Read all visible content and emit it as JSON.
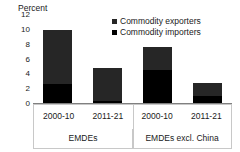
{
  "chart_data": {
    "type": "bar",
    "subtype": "stacked-bar-grouped",
    "title": "",
    "subtitle": "",
    "xlabel": "",
    "ylabel": "Percent",
    "ylim": [
      0,
      12
    ],
    "ytick_labels": [
      "0",
      "2",
      "4",
      "6",
      "8",
      "10",
      "12"
    ],
    "ytick_values": [
      0,
      2,
      4,
      6,
      8,
      10,
      12
    ],
    "grid": false,
    "legend_position": "top-right",
    "categories": [
      "2000-10",
      "2011-21",
      "2000-10",
      "2011-21"
    ],
    "groups": [
      {
        "label": "EMDEs",
        "categories": [
          "2000-10",
          "2011-21"
        ]
      },
      {
        "label": "EMDEs excl. China",
        "categories": [
          "2000-10",
          "2011-21"
        ]
      }
    ],
    "series": [
      {
        "name": "Commodity importers",
        "color": "#000000",
        "values": [
          2.5,
          0.3,
          4.4,
          1.0
        ]
      },
      {
        "name": "Commodity exporters",
        "color": "#262626",
        "values": [
          7.3,
          4.4,
          3.1,
          1.7
        ]
      }
    ],
    "totals": [
      9.8,
      4.7,
      7.5,
      2.7
    ],
    "annotations": []
  },
  "axis": {
    "title": "Percent"
  },
  "legend": {
    "items": [
      {
        "label": "Commodity exporters",
        "color": "#262626"
      },
      {
        "label": "Commodity importers",
        "color": "#000000"
      }
    ]
  },
  "xaxis": {
    "periods": [
      "2000-10",
      "2011-21",
      "2000-10",
      "2011-21"
    ],
    "groups": [
      "EMDEs",
      "EMDEs excl. China"
    ]
  },
  "colors": {
    "exporters": "#262626",
    "importers": "#000000",
    "frame": "#c8c8c8",
    "axis": "#808080",
    "text": "#1a1a1a",
    "background": "#ffffff"
  }
}
